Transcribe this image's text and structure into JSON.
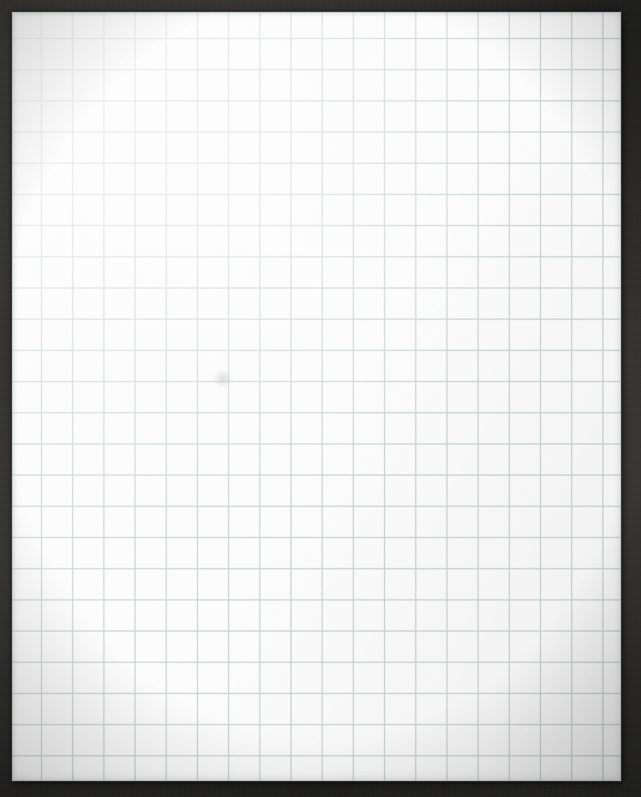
{
  "scene": {
    "subject": "blank-graph-paper-sheet",
    "description": "Photograph of a blank sheet of white quadrille graph paper resting on a dark charcoal surface",
    "canvas_width_px": 641,
    "canvas_height_px": 797,
    "background_color": "#2e2d2c",
    "vignette": true
  },
  "paper": {
    "label": "graph paper sheet",
    "color": "#fdfdfd",
    "left_px": 12,
    "top_px": 12,
    "width_px": 609,
    "height_px": 769,
    "edge_shadow_color": "#000000",
    "has_content": false,
    "visible_text": "",
    "blemishes": [
      {
        "name": "faint-smudge",
        "x_px": 223,
        "y_px": 379,
        "width_px": 18,
        "height_px": 16,
        "color": "#96989c"
      }
    ]
  },
  "grid": {
    "label": "quadrille grid ruling",
    "line_color": "#d4d9d9",
    "line_width_px": 1,
    "cell_size_px": 31.2,
    "first_vertical_line_x_px": 41,
    "first_horizontal_line_y_px": 38,
    "columns_visible": 19,
    "rows_visible": 24,
    "edges_clipped": true,
    "has_major_lines": false,
    "has_margin_rule": false
  },
  "annotations": {
    "marks": [],
    "text_present": false,
    "note": "Sheet is entirely blank - no writing, drawing, labels or printed header"
  }
}
